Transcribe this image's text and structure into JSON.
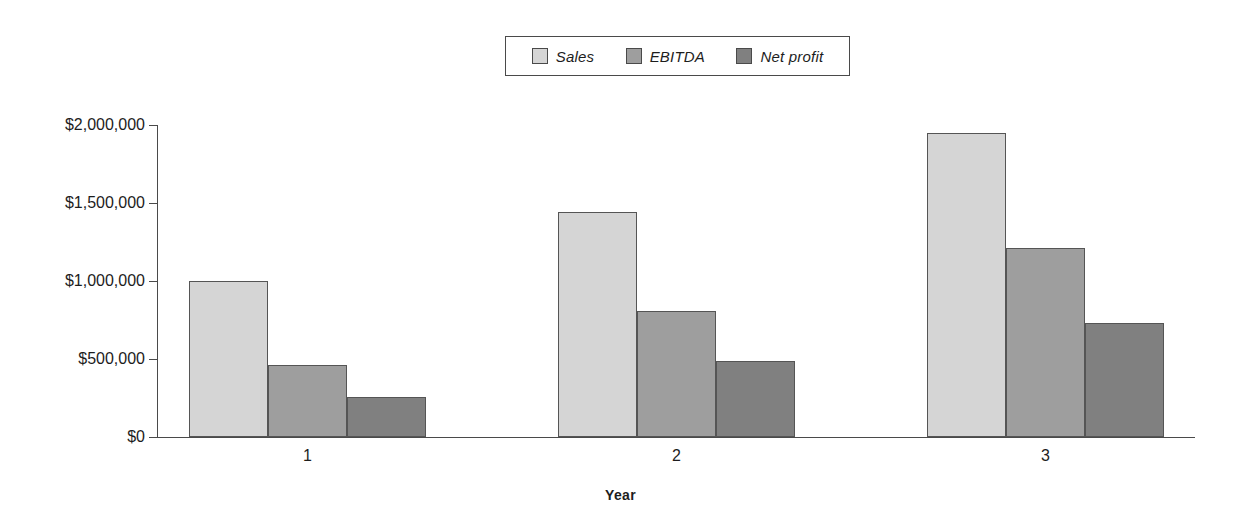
{
  "chart_data": {
    "type": "bar",
    "title": "",
    "xlabel": "Year",
    "ylabel": "",
    "categories": [
      "1",
      "2",
      "3"
    ],
    "series": [
      {
        "name": "Sales",
        "values": [
          1000000,
          1440000,
          1950000
        ],
        "color": "#d5d5d5"
      },
      {
        "name": "EBITDA",
        "values": [
          460000,
          810000,
          1210000
        ],
        "color": "#9e9e9e"
      },
      {
        "name": "Net profit",
        "values": [
          255000,
          487000,
          730000
        ],
        "color": "#808080"
      }
    ],
    "ylim": [
      0,
      2000000
    ],
    "ytick_values": [
      0,
      500000,
      1000000,
      1500000,
      2000000
    ],
    "ytick_labels": [
      "$0",
      "$500,000",
      "$1,000,000",
      "$1,500,000",
      "$2,000,000"
    ],
    "grid": false,
    "legend_position": "top-center",
    "bar_border_color": "#555555",
    "axis_color": "#4a4a4a"
  },
  "legend": {
    "entries": [
      {
        "label": "Sales"
      },
      {
        "label": "EBITDA"
      },
      {
        "label": "Net profit"
      }
    ]
  },
  "axis": {
    "x_title": "Year"
  }
}
